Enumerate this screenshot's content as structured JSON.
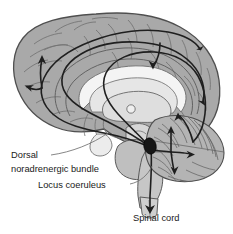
{
  "figure": {
    "type": "anatomical-diagram",
    "background_color": "#ffffff",
    "view": "midsagittal section of human brain"
  },
  "labels": {
    "dorsal_bundle_line1": "Dorsal",
    "dorsal_bundle_line2": "noradrenergic bundle",
    "locus_coeruleus": "Locus coeruleus",
    "spinal_cord": "Spinal cord"
  },
  "structures": {
    "cortex": {
      "name": "cerebral cortex",
      "fill": "#a9a9a9",
      "stroke": "#5a5a5a"
    },
    "corpus_callosum": {
      "name": "corpus callosum",
      "fill": "#f2f2f2",
      "stroke": "#6b6b6b"
    },
    "thalamus": {
      "name": "thalamus",
      "fill": "#dcdcdc",
      "stroke": "#6b6b6b"
    },
    "massa_intermedia": {
      "name": "massa intermedia",
      "fill": "#ededed",
      "stroke": "#6b6b6b"
    },
    "brainstem": {
      "name": "brainstem",
      "fill": "#c9c9c9",
      "stroke": "#5a5a5a"
    },
    "pons": {
      "name": "pons",
      "fill": "#bdbdbd",
      "stroke": "#5a5a5a"
    },
    "cerebellum": {
      "name": "cerebellum",
      "fill": "#b2b2b2",
      "stroke": "#555555"
    },
    "locus_coeruleus_marker": {
      "name": "locus coeruleus nucleus",
      "fill": "#1a1a1a",
      "stroke": "#000000"
    },
    "spinal_cord_structure": {
      "name": "spinal cord",
      "fill": "#cccccc",
      "stroke": "#5a5a5a"
    }
  },
  "pathways": {
    "stroke_color": "#1f1f1f",
    "stroke_width": 1.6,
    "arrow_color": "#1f1f1f",
    "description": "Ascending and descending noradrenergic projections from the locus coeruleus",
    "targets": [
      "frontal cortex",
      "cingulate cortex",
      "parietal cortex",
      "occipital cortex",
      "cerebellum",
      "spinal cord"
    ]
  }
}
